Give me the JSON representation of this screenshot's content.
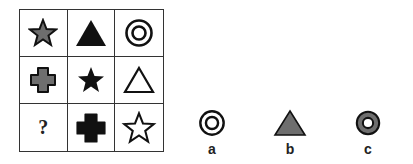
{
  "puzzle": {
    "grid": [
      {
        "row": 1,
        "col": 1,
        "shape": "star",
        "fill": "gray"
      },
      {
        "row": 1,
        "col": 2,
        "shape": "triangle",
        "fill": "black"
      },
      {
        "row": 1,
        "col": 3,
        "shape": "concentric-circles",
        "fill": "outline"
      },
      {
        "row": 2,
        "col": 1,
        "shape": "cross",
        "fill": "gray"
      },
      {
        "row": 2,
        "col": 2,
        "shape": "star",
        "fill": "black"
      },
      {
        "row": 2,
        "col": 3,
        "shape": "triangle",
        "fill": "outline"
      },
      {
        "row": 3,
        "col": 1,
        "shape": "missing",
        "label": "?"
      },
      {
        "row": 3,
        "col": 2,
        "shape": "cross",
        "fill": "black"
      },
      {
        "row": 3,
        "col": 3,
        "shape": "star",
        "fill": "outline"
      }
    ],
    "missing_label": "?"
  },
  "options": [
    {
      "label": "a",
      "shape": "concentric-circles",
      "fill": "outline"
    },
    {
      "label": "b",
      "shape": "triangle",
      "fill": "gray"
    },
    {
      "label": "c",
      "shape": "ring",
      "fill": "gray"
    }
  ],
  "colors": {
    "black": "#111111",
    "gray": "#6e6e6e",
    "outline": "#ffffff",
    "line": "#333333"
  }
}
